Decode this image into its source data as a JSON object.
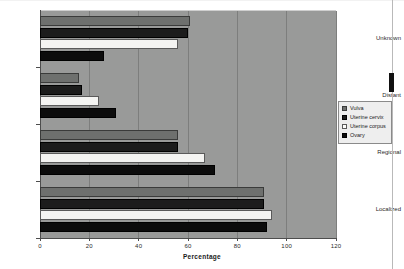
{
  "chart_data": {
    "type": "bar",
    "orientation": "horizontal",
    "title": "",
    "xlabel": "Percentage",
    "ylabel": "",
    "xlim": [
      0,
      120
    ],
    "xticks": [
      0,
      20,
      40,
      60,
      80,
      100,
      120
    ],
    "grid": true,
    "legend_position": "right",
    "categories": [
      "Localized",
      "Regional",
      "Distant",
      "Unknown"
    ],
    "series": [
      {
        "name": "Vulva",
        "color": "#6e706e",
        "values": [
          91,
          56,
          16,
          61
        ]
      },
      {
        "name": "Uterine cervix",
        "color": "#1c1c1c",
        "values": [
          91,
          56,
          17,
          60
        ]
      },
      {
        "name": "Uterine corpus",
        "color": "#f4f4f2",
        "values": [
          94,
          67,
          24,
          56
        ]
      },
      {
        "name": "Ovary",
        "color": "#0c0c0c",
        "values": [
          92,
          71,
          31,
          26
        ]
      }
    ]
  },
  "axes": {
    "x_title": "Percentage",
    "x_tick_labels": [
      "0",
      "20",
      "40",
      "60",
      "80",
      "100",
      "120"
    ],
    "y_tick_labels": [
      "Unknown",
      "Distant",
      "Regional",
      "Localized"
    ]
  },
  "legend": {
    "items": [
      {
        "label": "Vulva"
      },
      {
        "label": "Uterine cervix"
      },
      {
        "label": "Uterine corpus"
      },
      {
        "label": "Ovary"
      }
    ]
  },
  "colors": {
    "plot_background": "#999a99",
    "page_background": "#ffffff",
    "gridline": "#7d7e7d",
    "axis": "#4d4d4d"
  }
}
